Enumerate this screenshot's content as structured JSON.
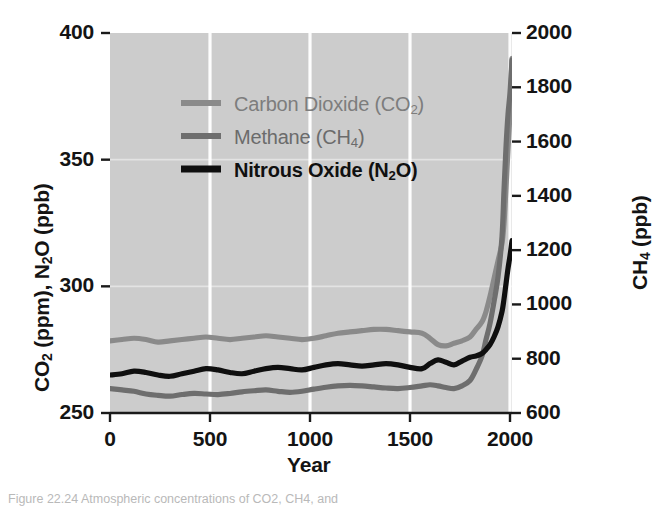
{
  "figure": {
    "caption": "Figure 22.24 Atmospheric concentrations of CO2, CH4, and"
  },
  "chart_data": {
    "type": "line",
    "title": "",
    "xlabel": "Year",
    "ylabel_left": "CO2 (ppm), N2O (ppb)",
    "ylabel_right": "CH4 (ppb)",
    "xlim": [
      0,
      2010
    ],
    "ylim_left": [
      250,
      400
    ],
    "ylim_right": [
      600,
      2000
    ],
    "xticks": [
      0,
      500,
      1000,
      1500,
      2000
    ],
    "xtick_labels": [
      "0",
      "500",
      "1000",
      "1500",
      "2000"
    ],
    "yticks_left": [
      250,
      300,
      350,
      400
    ],
    "ytick_labels_left": [
      "250",
      "300",
      "350",
      "400"
    ],
    "yticks_right": [
      600,
      800,
      1000,
      1200,
      1400,
      1600,
      1800,
      2000
    ],
    "ytick_labels_right": [
      "600",
      "800",
      "1000",
      "1200",
      "1400",
      "1600",
      "1800",
      "2000"
    ],
    "grid": true,
    "grid_color": "#ffffff",
    "plot_background": "#cccccc",
    "legend_position": "upper-left-inside",
    "series": [
      {
        "name": "Carbon Dioxide (CO2)",
        "legend_label": "Carbon Dioxide (CO2)",
        "axis": "left",
        "units": "ppm",
        "color": "#8a8a8a",
        "x": [
          0,
          60,
          120,
          180,
          240,
          300,
          360,
          420,
          480,
          540,
          600,
          660,
          720,
          780,
          840,
          900,
          960,
          1020,
          1080,
          1140,
          1200,
          1260,
          1320,
          1380,
          1440,
          1500,
          1560,
          1600,
          1640,
          1680,
          1720,
          1760,
          1800,
          1830,
          1860,
          1880,
          1900,
          1920,
          1940,
          1960,
          1970,
          1980,
          1990,
          2000,
          2010
        ],
        "y": [
          278.5,
          279.0,
          279.5,
          279.0,
          278.0,
          278.5,
          279.0,
          279.5,
          280.0,
          279.5,
          279.0,
          279.5,
          280.0,
          280.5,
          280.0,
          279.5,
          279.0,
          279.5,
          280.5,
          281.5,
          282.0,
          282.5,
          283.0,
          283.0,
          282.5,
          282.0,
          281.5,
          279.5,
          277.0,
          276.5,
          277.5,
          278.5,
          280.0,
          283.0,
          286.0,
          290.0,
          296.0,
          303.0,
          310.0,
          317.0,
          325.0,
          339.0,
          354.0,
          369.0,
          390.0
        ]
      },
      {
        "name": "Methane (CH4)",
        "legend_label": "Methane (CH4)",
        "axis": "right",
        "units": "ppb",
        "color": "#6e6e6e",
        "x": [
          0,
          60,
          120,
          180,
          240,
          300,
          360,
          420,
          480,
          540,
          600,
          660,
          720,
          780,
          840,
          900,
          960,
          1020,
          1080,
          1140,
          1200,
          1260,
          1320,
          1380,
          1440,
          1500,
          1560,
          1600,
          1640,
          1680,
          1720,
          1760,
          1800,
          1830,
          1860,
          1880,
          1900,
          1920,
          1940,
          1960,
          1970,
          1980,
          1990,
          2000,
          2010
        ],
        "y": [
          690,
          685,
          680,
          670,
          665,
          662,
          668,
          672,
          670,
          668,
          672,
          678,
          682,
          685,
          680,
          676,
          680,
          688,
          695,
          700,
          702,
          700,
          696,
          692,
          690,
          694,
          700,
          704,
          700,
          694,
          690,
          700,
          720,
          760,
          810,
          870,
          930,
          1010,
          1100,
          1250,
          1420,
          1580,
          1700,
          1780,
          1900
        ]
      },
      {
        "name": "Nitrous Oxide (N2O)",
        "legend_label": "Nitrous Oxide (N2O)",
        "axis": "left",
        "units": "ppb",
        "color": "#0f0f0f",
        "x": [
          0,
          60,
          120,
          180,
          240,
          300,
          360,
          420,
          480,
          540,
          600,
          660,
          720,
          780,
          840,
          900,
          960,
          1020,
          1080,
          1140,
          1200,
          1260,
          1320,
          1380,
          1440,
          1500,
          1560,
          1600,
          1640,
          1680,
          1720,
          1760,
          1800,
          1830,
          1860,
          1880,
          1900,
          1920,
          1940,
          1960,
          1970,
          1980,
          1990,
          2000,
          2010
        ],
        "y": [
          265.0,
          265.5,
          266.5,
          266.0,
          265.0,
          264.5,
          265.5,
          266.5,
          267.5,
          267.0,
          266.0,
          265.5,
          266.5,
          267.5,
          268.0,
          267.5,
          267.0,
          268.0,
          269.0,
          269.5,
          269.0,
          268.5,
          269.0,
          269.5,
          269.0,
          268.0,
          267.5,
          269.5,
          271.0,
          270.0,
          269.0,
          270.5,
          272.0,
          272.5,
          273.5,
          275.0,
          277.0,
          280.0,
          284.0,
          290.0,
          295.0,
          301.0,
          307.0,
          312.0,
          318.0
        ]
      }
    ]
  },
  "axes": {
    "x_title": "Year"
  },
  "legend": {
    "items": [
      {
        "label_main": "Carbon Dioxide (CO",
        "label_sub": "2",
        "label_tail": ")",
        "swatch_color": "#8a8a8a"
      },
      {
        "label_main": "Methane (CH",
        "label_sub": "4",
        "label_tail": ")",
        "swatch_color": "#6e6e6e"
      },
      {
        "label_main": "Nitrous Oxide (N",
        "label_sub": "2",
        "label_tail": "O)",
        "swatch_color": "#0f0f0f"
      }
    ]
  },
  "left_axis_title": {
    "part1": "CO",
    "sub1": "2",
    "part2": " (ppm), N",
    "sub2": "2",
    "part3": "O (ppb)"
  },
  "right_axis_title": {
    "part1": "CH",
    "sub1": "4",
    "part2": " (ppb)"
  }
}
